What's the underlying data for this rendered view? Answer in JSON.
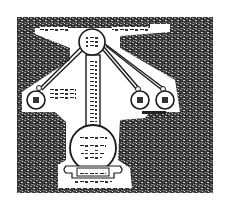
{
  "figure": {
    "colors": {
      "ink": "#1a1a1a",
      "paper": "#ffffff",
      "noise_dark": "#2b2b2b",
      "noise_light": "#8a8a8a"
    },
    "nodes": {
      "top_circle": {
        "label": ""
      },
      "left_circle": {
        "label": ""
      },
      "right_circle_1": {
        "label": ""
      },
      "right_circle_2": {
        "label": ""
      },
      "bottom_circle": {
        "label": ""
      },
      "scroll_banner": {
        "label": ""
      }
    }
  }
}
